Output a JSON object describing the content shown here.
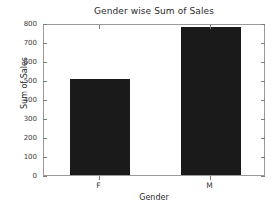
{
  "chart_data": {
    "type": "bar",
    "title": "Gender wise Sum of Sales",
    "xlabel": "Gender",
    "ylabel": "Sum of Sales",
    "categories": [
      "F",
      "M"
    ],
    "values": [
      505,
      779
    ],
    "ylim": [
      0,
      800
    ],
    "yticks": [
      0,
      100,
      200,
      300,
      400,
      500,
      600,
      700,
      800
    ],
    "ytick_labels": [
      "0",
      "100",
      "200",
      "300",
      "400",
      "500",
      "600",
      "700",
      "800"
    ],
    "grid": false,
    "legend": false,
    "bar_color": "#1a1a1a",
    "background_color": "#ffffff",
    "axes_color": "#9a9a9a"
  }
}
